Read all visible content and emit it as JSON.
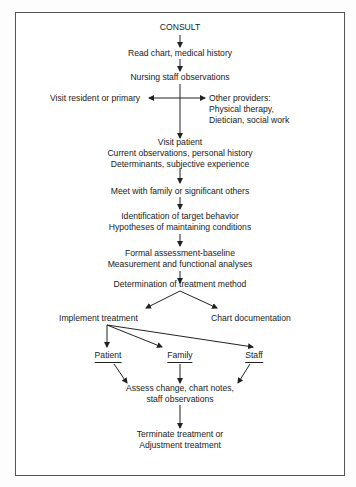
{
  "diagram": {
    "type": "flowchart",
    "nodes": {
      "consult": "CONSULT",
      "read_chart": "Read chart, medical history",
      "nursing": "Nursing staff observations",
      "visit_resident": "Visit resident or primary",
      "other_providers": [
        "Other providers:",
        "Physical therapy,",
        "Dietician, social work"
      ],
      "visit_patient": [
        "Visit patient",
        "Current observations, personal history",
        "Determinants, subjective experience"
      ],
      "meet_family": "Meet with family or significant others",
      "identification": [
        "Identification of target behavior",
        "Hypotheses of maintaining conditions"
      ],
      "formal_assessment": [
        "Formal assessment-baseline",
        "Measurement and functional analyses"
      ],
      "determination": "Determination of treatment method",
      "implement": "Implement  treatment",
      "chart_doc": "Chart documentation",
      "patient": "Patient",
      "family": "Family",
      "staff": "Staff",
      "assess": [
        "Assess change, chart notes,",
        "staff observations"
      ],
      "terminate": [
        "Terminate treatment or",
        "Adjustment treatment"
      ]
    },
    "edges": [
      [
        "consult",
        "read_chart"
      ],
      [
        "read_chart",
        "nursing"
      ],
      [
        "nursing",
        "visit_resident"
      ],
      [
        "nursing",
        "other_providers"
      ],
      [
        "nursing",
        "visit_patient"
      ],
      [
        "visit_patient",
        "meet_family"
      ],
      [
        "meet_family",
        "identification"
      ],
      [
        "identification",
        "formal_assessment"
      ],
      [
        "formal_assessment",
        "determination"
      ],
      [
        "determination",
        "implement"
      ],
      [
        "determination",
        "chart_doc"
      ],
      [
        "implement",
        "patient"
      ],
      [
        "implement",
        "family"
      ],
      [
        "implement",
        "staff"
      ],
      [
        "patient",
        "assess"
      ],
      [
        "family",
        "assess"
      ],
      [
        "staff",
        "assess"
      ],
      [
        "assess",
        "terminate"
      ]
    ],
    "colors": {
      "line": "#222222",
      "border": "#555555",
      "background": "#ffffff"
    }
  }
}
